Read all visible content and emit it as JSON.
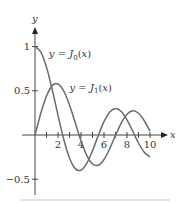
{
  "chart_data": {
    "type": "line",
    "title": "",
    "xlabel": "x",
    "ylabel": "y",
    "xlim": [
      0,
      10
    ],
    "ylim": [
      -0.5,
      1
    ],
    "grid": false,
    "x_ticks": [
      1,
      2,
      3,
      4,
      5,
      6,
      7,
      8,
      9,
      10
    ],
    "x_tick_labels": [
      "2",
      "4",
      "6",
      "8",
      "10"
    ],
    "x_tick_label_values": [
      2,
      4,
      6,
      8,
      10
    ],
    "y_tick_labels": [
      "1",
      "0.5",
      "−0.5"
    ],
    "y_tick_label_values": [
      1,
      0.5,
      -0.5
    ],
    "x": [
      0,
      0.5,
      1,
      1.5,
      2,
      2.5,
      3,
      3.5,
      4,
      4.5,
      5,
      5.5,
      6,
      6.5,
      7,
      7.5,
      8,
      8.5,
      9,
      9.5,
      10
    ],
    "series": [
      {
        "name": "y = J0(x)",
        "values": [
          1.0,
          0.9385,
          0.7652,
          0.5118,
          0.2239,
          -0.0484,
          -0.2601,
          -0.3801,
          -0.3971,
          -0.3205,
          -0.1776,
          -0.0068,
          0.1506,
          0.2601,
          0.3001,
          0.2663,
          0.1717,
          0.0419,
          -0.0903,
          -0.1939,
          -0.2459
        ]
      },
      {
        "name": "y = J1(x)",
        "values": [
          0.0,
          0.2423,
          0.4401,
          0.5579,
          0.5767,
          0.4971,
          0.3391,
          0.1374,
          -0.066,
          -0.2311,
          -0.3276,
          -0.3414,
          -0.2767,
          -0.1538,
          -0.0047,
          0.1352,
          0.2346,
          0.2731,
          0.2453,
          0.1613,
          0.0435
        ]
      }
    ],
    "annotations": [
      {
        "text_prefix": "y = ",
        "func": "J",
        "sub": "0",
        "arg": "(x)",
        "anchor_x": 1.2,
        "anchor_y": 0.88
      },
      {
        "text_prefix": "y = ",
        "func": "J",
        "sub": "1",
        "arg": "(x)",
        "anchor_x": 3.0,
        "anchor_y": 0.5
      }
    ],
    "line_color": "#6b6b6b",
    "axis_color": "#444444"
  }
}
